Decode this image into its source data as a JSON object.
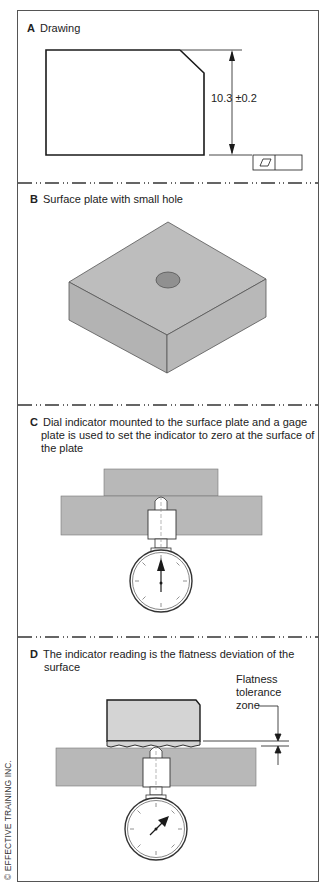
{
  "figure": {
    "copyright": "© EFFECTIVE TRAINING INC.",
    "colors": {
      "border": "#555555",
      "plate_fill": "#b8b8b8",
      "plate_top": "#bdbdbd",
      "plate_side": "#b0b0b0",
      "hole": "#8f8f8f",
      "part_fill": "#d4d4d4",
      "line": "#1a1a1a"
    }
  },
  "sections": [
    {
      "letter": "A",
      "title": "Drawing",
      "dimension": "10.3 ±0.2",
      "fcf": {
        "symbol": "flatness-parallelogram",
        "tolerance": "0.4"
      }
    },
    {
      "letter": "B",
      "title": "Surface plate with small hole"
    },
    {
      "letter": "C",
      "title_lines": [
        "Dial indicator mounted to the surface plate and a gage",
        "plate is used to set the indicator to zero at the surface of",
        "the plate"
      ]
    },
    {
      "letter": "D",
      "title_lines": [
        "The indicator reading is the flatness deviation of the",
        "surface"
      ],
      "part_label": "Part",
      "zone_label_lines": [
        "Flatness",
        "tolerance",
        "zone"
      ]
    }
  ]
}
